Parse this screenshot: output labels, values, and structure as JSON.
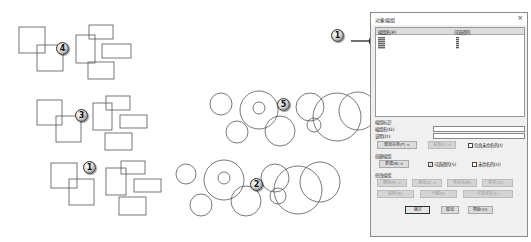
{
  "drawing": {
    "rect_groups": [
      {
        "callout": "4",
        "rects": [
          [
            19,
            27,
            26,
            26
          ],
          [
            37,
            45,
            26,
            26
          ],
          [
            76,
            35,
            19,
            28
          ],
          [
            89,
            25,
            24,
            14
          ],
          [
            102,
            44,
            29,
            14
          ],
          [
            88,
            62,
            26,
            17
          ]
        ]
      },
      {
        "callout": "3",
        "rects": [
          [
            37,
            100,
            25,
            25
          ],
          [
            56,
            116,
            25,
            26
          ],
          [
            93,
            103,
            19,
            27
          ],
          [
            106,
            96,
            24,
            14
          ],
          [
            120,
            115,
            27,
            13
          ],
          [
            105,
            133,
            27,
            17
          ]
        ]
      },
      {
        "callout": "1",
        "rects": [
          [
            51,
            163,
            26,
            25
          ],
          [
            69,
            179,
            25,
            26
          ],
          [
            106,
            168,
            20,
            27
          ],
          [
            121,
            161,
            24,
            13
          ],
          [
            134,
            179,
            27,
            13
          ],
          [
            119,
            197,
            27,
            18
          ]
        ]
      }
    ],
    "circle_groups": [
      {
        "callout": "5",
        "circles": [
          [
            221,
            104,
            11
          ],
          [
            259,
            110,
            19
          ],
          [
            259,
            108,
            6
          ],
          [
            280,
            131,
            15
          ],
          [
            310,
            107,
            14
          ],
          [
            314,
            125,
            7
          ],
          [
            337,
            117,
            24
          ],
          [
            358,
            111,
            19
          ],
          [
            237,
            132,
            11
          ]
        ]
      },
      {
        "callout": "2",
        "circles": [
          [
            186,
            174,
            10
          ],
          [
            224,
            180,
            20
          ],
          [
            224,
            178,
            6
          ],
          [
            246,
            201,
            15
          ],
          [
            275,
            178,
            14
          ],
          [
            278,
            196,
            8
          ],
          [
            298,
            190,
            24
          ],
          [
            320,
            182,
            20
          ],
          [
            201,
            205,
            11
          ]
        ]
      }
    ],
    "callouts": [
      {
        "label": "4",
        "x": 62,
        "y": 48
      },
      {
        "label": "3",
        "x": 81,
        "y": 115
      },
      {
        "label": "1",
        "x": 89,
        "y": 167
      },
      {
        "label": "5",
        "x": 283,
        "y": 104
      },
      {
        "label": "2",
        "x": 256,
        "y": 184
      },
      {
        "label": "1",
        "x": 337,
        "y": 35
      },
      {
        "label": "2",
        "x": 412,
        "y": 30
      },
      {
        "label": "4",
        "x": 402,
        "y": 61
      }
    ]
  },
  "dialog": {
    "title": "对象编组",
    "close_glyph": "×",
    "list": {
      "col_name": "编组名(P)",
      "col_selectable": "可选择的"
    },
    "group_identification": {
      "section_label": "编组标识",
      "name_label": "编组名(G):",
      "name_value": "",
      "description_label": "说明(D):",
      "description_value": "",
      "find_name_button": "查找名称(F) <",
      "highlight_button": "亮显(H) <",
      "include_unnamed_label": "包含未命名的(I)",
      "include_unnamed_checked": false
    },
    "create_group": {
      "section_label": "创建编组",
      "new_button": "新建(N) <",
      "selectable_label": "可选择的(S)",
      "selectable_checked": true,
      "unnamed_label": "未命名的(U)",
      "unnamed_checked": false
    },
    "change_group": {
      "section_label": "修改编组",
      "remove_button": "删除(R) <",
      "add_button": "添加(A) <",
      "rename_button": "重命名(M)",
      "reorder_button": "重排(O)...",
      "description_button": "说明(D)",
      "explode_button": "分解(E)",
      "selectable_button": "可选择的(L)"
    },
    "footer": {
      "ok_button": "确定",
      "cancel_button": "取消",
      "help_button": "帮助(H)"
    },
    "check_glyph": "✓"
  }
}
